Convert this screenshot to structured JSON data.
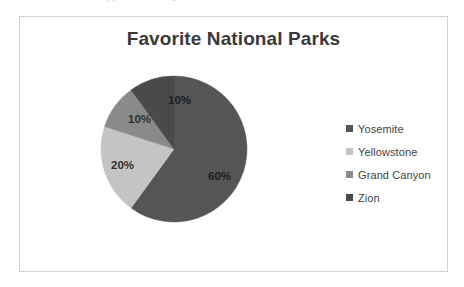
{
  "page": {
    "background_color": "#ffffff",
    "cut_off_text_sliver": "the bottom of a clipped line of body text above the chart"
  },
  "frame": {
    "border_color": "#d2d2d2",
    "background_color": "#ffffff"
  },
  "chart_data": {
    "type": "pie",
    "title": "Favorite National Parks",
    "xlabel": "",
    "ylabel": "",
    "categories": [
      "Yosemite",
      "Yellowstone",
      "Grand Canyon",
      "Zion"
    ],
    "values": [
      60,
      20,
      10,
      10
    ],
    "value_labels": [
      "60%",
      "20%",
      "10%",
      "10%"
    ],
    "colors": [
      "#555555",
      "#c4c4c4",
      "#8a8a8a",
      "#4a4a4a"
    ],
    "units": "percent",
    "start_angle_deg": 0,
    "direction": "clockwise",
    "labels_inside_slices": true,
    "legend_position": "right",
    "grid": false
  },
  "legend": {
    "items": [
      {
        "label": "Yosemite",
        "color": "#555555"
      },
      {
        "label": "Yellowstone",
        "color": "#c4c4c4"
      },
      {
        "label": "Grand Canyon",
        "color": "#8a8a8a"
      },
      {
        "label": "Zion",
        "color": "#4a4a4a"
      }
    ]
  },
  "slice_labels": [
    {
      "text": "60%",
      "slice": "Yosemite"
    },
    {
      "text": "20%",
      "slice": "Yellowstone"
    },
    {
      "text": "10%",
      "slice": "Grand Canyon"
    },
    {
      "text": "10%",
      "slice": "Zion"
    }
  ]
}
